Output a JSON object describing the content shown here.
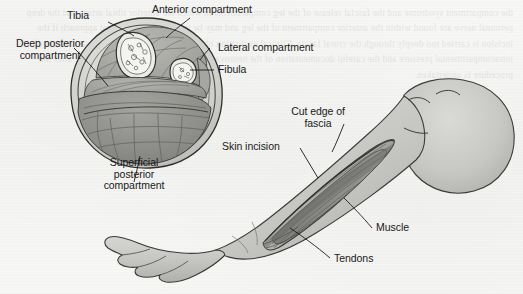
{
  "figure": {
    "type": "medical-illustration",
    "background_color": "#f6f6f4",
    "ink_color": "#1a1a1a",
    "skin_fill_color": "#c9c9c6",
    "skin_shadow_color": "#a9a9a5",
    "muscle_fill_color": "#8f8f8c",
    "bone_fill_color": "#e8e8e5"
  },
  "cross_section": {
    "name": "leg-cross-section",
    "labels": [
      {
        "id": "tibia",
        "text": "Tibia",
        "align": "center"
      },
      {
        "id": "anterior-compartment",
        "text": "Anterior compartment",
        "align": "left"
      },
      {
        "id": "deep-posterior-compartment",
        "text": "Deep posterior\ncompartment",
        "align": "center"
      },
      {
        "id": "lateral-compartment",
        "text": "Lateral compartment",
        "align": "left"
      },
      {
        "id": "fibula",
        "text": "Fibula",
        "align": "left"
      },
      {
        "id": "superficial-posterior-compartment",
        "text": "Superficial\nposterior\ncompartment",
        "align": "center"
      }
    ]
  },
  "leg_view": {
    "name": "leg-lateral-view",
    "labels": [
      {
        "id": "cut-edge-of-fascia",
        "text": "Cut edge of\nfascia",
        "align": "center"
      },
      {
        "id": "skin-incision",
        "text": "Skin incision",
        "align": "left"
      },
      {
        "id": "muscle",
        "text": "Muscle",
        "align": "left"
      },
      {
        "id": "tendons",
        "text": "Tendons",
        "align": "left"
      }
    ]
  },
  "bleed_through": {
    "note": "Faint mirrored text showing through from the reverse side of the scanned page; illegible.",
    "text": "the compartment syndrome and the fascial release of the leg compartments in which the anterior tibial artery and the deep peroneal nerve are found within the anterior compartment of the leg and may be injured during surgical approach if the incision is carried too deeply through the crural fascia. Clinical evaluation of the patient includes serial measurement of the intracompartmental pressure and the careful documentation of the neurovascular status of the limb before and after the procedure is undertaken."
  }
}
